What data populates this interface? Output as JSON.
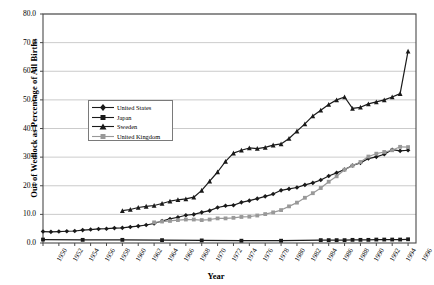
{
  "chart_data": {
    "type": "line",
    "title": "",
    "xlabel": "Year",
    "ylabel": "Out of Wedlock as Percentage of All Births",
    "xlim": [
      1950,
      1997
    ],
    "ylim": [
      0,
      80
    ],
    "ytick_step": 10,
    "xtick_step": 2,
    "grid": true,
    "legend_position": "inside-upper-left",
    "ytick_labels": [
      "0.0",
      "10.0",
      "20.0",
      "30.0",
      "40.0",
      "50.0",
      "60.0",
      "70.0",
      "80.0"
    ],
    "ytick_values": [
      0,
      10,
      20,
      30,
      40,
      50,
      60,
      70,
      80
    ],
    "xtick_labels": [
      "1950",
      "1952",
      "1954",
      "1956",
      "1958",
      "1960",
      "1962",
      "1964",
      "1966",
      "1968",
      "1970",
      "1972",
      "1974",
      "1976",
      "1978",
      "1980",
      "1982",
      "1984",
      "1986",
      "1988",
      "1990",
      "1992",
      "1994",
      "1996"
    ],
    "xtick_values": [
      1950,
      1952,
      1954,
      1956,
      1958,
      1960,
      1962,
      1964,
      1966,
      1968,
      1970,
      1972,
      1974,
      1976,
      1978,
      1980,
      1982,
      1984,
      1986,
      1988,
      1990,
      1992,
      1994,
      1996
    ],
    "series": [
      {
        "name": "United States",
        "color": "#1a1a1a",
        "marker": "diamond",
        "x": [
          1950,
          1951,
          1952,
          1953,
          1954,
          1955,
          1956,
          1957,
          1958,
          1959,
          1960,
          1961,
          1962,
          1963,
          1964,
          1965,
          1966,
          1967,
          1968,
          1969,
          1970,
          1971,
          1972,
          1973,
          1974,
          1975,
          1976,
          1977,
          1978,
          1979,
          1980,
          1981,
          1982,
          1983,
          1984,
          1985,
          1986,
          1987,
          1988,
          1989,
          1990,
          1991,
          1992,
          1993,
          1994,
          1995,
          1996
        ],
        "y": [
          4.0,
          3.9,
          4.0,
          4.1,
          4.2,
          4.5,
          4.7,
          4.9,
          5.0,
          5.2,
          5.3,
          5.6,
          5.9,
          6.3,
          6.8,
          7.7,
          8.4,
          9.0,
          9.7,
          10.0,
          10.7,
          11.3,
          12.4,
          13.0,
          13.2,
          14.2,
          14.8,
          15.5,
          16.3,
          17.1,
          18.4,
          18.9,
          19.4,
          20.3,
          21.0,
          22.0,
          23.4,
          24.5,
          25.7,
          27.1,
          28.0,
          29.5,
          30.1,
          31.0,
          32.6,
          32.2,
          32.4
        ]
      },
      {
        "name": "Japan",
        "color": "#1a1a1a",
        "marker": "square",
        "x": [
          1950,
          1955,
          1960,
          1965,
          1970,
          1975,
          1980,
          1985,
          1986,
          1987,
          1988,
          1989,
          1990,
          1991,
          1992,
          1993,
          1994,
          1995,
          1996
        ],
        "y": [
          1.2,
          1.1,
          1.1,
          1.0,
          0.9,
          0.8,
          0.8,
          1.0,
          1.0,
          1.0,
          1.0,
          1.1,
          1.1,
          1.1,
          1.2,
          1.2,
          1.2,
          1.2,
          1.3
        ]
      },
      {
        "name": "Sweden",
        "color": "#1a1a1a",
        "marker": "triangle",
        "x": [
          1960,
          1961,
          1962,
          1963,
          1964,
          1965,
          1966,
          1967,
          1968,
          1969,
          1970,
          1971,
          1972,
          1973,
          1974,
          1975,
          1976,
          1977,
          1978,
          1979,
          1980,
          1981,
          1982,
          1983,
          1984,
          1985,
          1986,
          1987,
          1988,
          1989,
          1990,
          1991,
          1992,
          1993,
          1994,
          1995,
          1996
        ],
        "y": [
          11.3,
          11.7,
          12.4,
          12.8,
          13.1,
          13.8,
          14.6,
          15.1,
          15.4,
          16.0,
          18.4,
          21.6,
          24.8,
          28.5,
          31.4,
          32.4,
          33.2,
          33.0,
          33.4,
          34.2,
          34.6,
          36.5,
          39.1,
          41.6,
          44.4,
          46.4,
          48.4,
          50.0,
          51.0,
          47.0,
          47.4,
          48.6,
          49.3,
          50.0,
          51.0,
          52.2,
          67.0
        ]
      },
      {
        "name": "United Kingdom",
        "color": "#999999",
        "marker": "square",
        "x": [
          1964,
          1965,
          1966,
          1967,
          1968,
          1969,
          1970,
          1971,
          1972,
          1973,
          1974,
          1975,
          1976,
          1977,
          1978,
          1979,
          1980,
          1981,
          1982,
          1983,
          1984,
          1985,
          1986,
          1987,
          1988,
          1989,
          1990,
          1991,
          1992,
          1993,
          1994,
          1995,
          1996
        ],
        "y": [
          7.2,
          7.5,
          7.7,
          8.0,
          8.2,
          8.2,
          8.0,
          8.2,
          8.6,
          8.6,
          8.8,
          9.1,
          9.2,
          9.6,
          10.1,
          10.7,
          11.5,
          12.8,
          14.1,
          15.8,
          17.4,
          19.2,
          21.4,
          23.3,
          25.6,
          27.0,
          28.3,
          30.2,
          31.2,
          31.8,
          32.4,
          33.6,
          33.5
        ]
      }
    ]
  }
}
